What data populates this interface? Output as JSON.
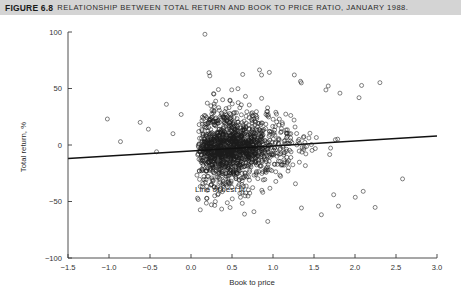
{
  "caption": {
    "label": "FIGURE 6.8",
    "text": "RELATIONSHIP BETWEEN TOTAL RETURN AND BOOK TO PRICE RATIO, JANUARY 1988."
  },
  "annotation": {
    "best_fit_label": "Line of best fit"
  },
  "chart_data": {
    "type": "scatter",
    "title": "Relationship between total return and book to price ratio, January 1988.",
    "xlabel": "Book to price",
    "ylabel": "Total return, %",
    "xlim": [
      -1.5,
      3.0
    ],
    "ylim": [
      -100,
      100
    ],
    "xticks": [
      -1.5,
      -1.0,
      -0.5,
      0.0,
      0.5,
      1.0,
      1.5,
      2.0,
      2.5,
      3.0
    ],
    "xtick_labels": [
      "−1.5",
      "−1.0",
      "−0.5",
      "0.0",
      "0.5",
      "1.0",
      "1.5",
      "2.0",
      "2.5",
      "3.0"
    ],
    "yticks": [
      -100,
      -50,
      0,
      50,
      100
    ],
    "ytick_labels": [
      "−100",
      "−50",
      "0",
      "50",
      "100"
    ],
    "grid": false,
    "legend": "none",
    "marker": "open-circle",
    "marker_size": 2.0,
    "marker_color": "#1b1b1b",
    "fit_line": {
      "label": "Line of best fit",
      "color": "#111111",
      "x_start": -1.5,
      "y_start": -12.0,
      "x_end": 3.0,
      "y_end": 8.0,
      "slope": 4.44,
      "intercept": -5.33
    },
    "annotation_arrow": {
      "text": "Line of best fit",
      "text_x": 0.05,
      "text_y": -42.0,
      "tip_x": 0.33,
      "tip_y": -8.0
    },
    "n_points": 1220,
    "cluster_note": "Dense cluster concentrated between book-to-price 0.0 and 2.2, centered near total return 0%, with a handful of sparse outliers between -1.2 and 0.0 and a high outlier near 98% at book to price 0.17.",
    "sparse_left_points": [
      [
        -1.02,
        23.0
      ],
      [
        -0.86,
        3.0
      ],
      [
        -0.62,
        20.0
      ],
      [
        -0.52,
        14.0
      ],
      [
        -0.42,
        -6.0
      ],
      [
        -0.3,
        36.0
      ],
      [
        -0.22,
        10.0
      ],
      [
        -0.12,
        27.0
      ]
    ],
    "notable_outliers": [
      [
        0.17,
        98.0
      ],
      [
        0.22,
        64.0
      ],
      [
        1.26,
        62.0
      ],
      [
        0.08,
        -47.0
      ],
      [
        1.74,
        -44.0
      ],
      [
        0.62,
        -42.0
      ],
      [
        2.1,
        -41.0
      ],
      [
        2.58,
        -30.0
      ]
    ]
  }
}
